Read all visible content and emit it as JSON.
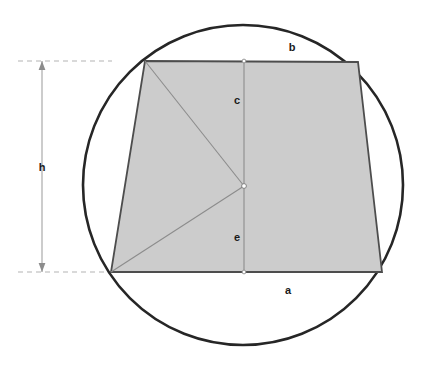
{
  "figure": {
    "kind": "geometry-diagram",
    "canvas": {
      "width": 429,
      "height": 368
    },
    "colors": {
      "background": "#ffffff",
      "shape_fill": "#cccccc",
      "circle_stroke": "#262626",
      "shape_stroke": "#4d4d4d",
      "inner_line_stroke": "#8c8c8c",
      "dimension_stroke": "#999999",
      "dimension_dash": "#b3b3b3",
      "label_text": "#1a1a1a"
    },
    "circle": {
      "name": "circumscribed-circle",
      "cx": 243,
      "cy": 185,
      "r": 160,
      "stroke_width": 2.6
    },
    "trapezoid": {
      "name": "inscribed-trapezoid",
      "points": "145,61 358,62 382,272 111,272",
      "vertices": [
        {
          "id": "top-left",
          "x": 145,
          "y": 61
        },
        {
          "id": "top-right",
          "x": 358,
          "y": 62
        },
        {
          "id": "bottom-right",
          "x": 382,
          "y": 272
        },
        {
          "id": "bottom-left",
          "x": 111,
          "y": 272
        }
      ],
      "stroke_width": 1.8
    },
    "center_point": {
      "name": "circle-center-dot",
      "x": 244,
      "y": 186,
      "r": 2.4
    },
    "inner_lines": [
      {
        "id": "vertical-axis",
        "x1": 244,
        "y1": 61,
        "x2": 244,
        "y2": 272
      },
      {
        "id": "radius-to-top-left",
        "x1": 145,
        "y1": 61,
        "x2": 244,
        "y2": 186
      },
      {
        "id": "radius-to-bottom-left",
        "x1": 111,
        "y1": 272,
        "x2": 244,
        "y2": 186
      }
    ],
    "edge_dots": [
      {
        "id": "top-edge-midpoint-dot",
        "x": 244,
        "y": 61,
        "r": 1.9
      },
      {
        "id": "bottom-edge-midpoint-dot",
        "x": 244,
        "y": 272,
        "r": 1.9
      }
    ],
    "dimension": {
      "name": "height-dimension",
      "axis_x": 42,
      "top_y": 61,
      "bottom_y": 272,
      "arrow_half_width": 3.4,
      "arrow_length": 9,
      "leaders": [
        {
          "id": "top-leader",
          "x1": 18,
          "y1": 61,
          "x2": 112,
          "y2": 61
        },
        {
          "id": "bottom-leader",
          "x1": 18,
          "y1": 272,
          "x2": 112,
          "y2": 272
        }
      ],
      "dash_pattern": "5,4"
    },
    "labels": [
      {
        "id": "label-b",
        "name": "side-label-b",
        "text": "b",
        "x": 292,
        "y": 47,
        "align": "center"
      },
      {
        "id": "label-c",
        "name": "segment-label-c",
        "text": "c",
        "x": 237,
        "y": 100,
        "align": "center"
      },
      {
        "id": "label-e",
        "name": "segment-label-e",
        "text": "e",
        "x": 237,
        "y": 237,
        "align": "center"
      },
      {
        "id": "label-a",
        "name": "side-label-a",
        "text": "a",
        "x": 288,
        "y": 290,
        "align": "center"
      },
      {
        "id": "label-h",
        "name": "height-label-h",
        "text": "h",
        "x": 42,
        "y": 167,
        "align": "center"
      }
    ]
  }
}
